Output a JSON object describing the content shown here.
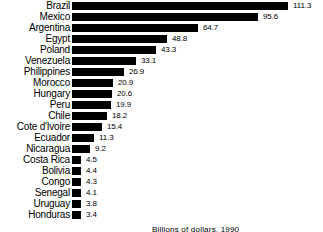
{
  "chart_data": {
    "type": "bar",
    "orientation": "horizontal",
    "title": "",
    "subtitle": "",
    "xlabel": "Billions of dollars, 1990",
    "ylabel": "",
    "grid": false,
    "legend": null,
    "xlim": [
      0,
      115
    ],
    "categories": [
      "Brazil",
      "Mexico",
      "Argentina",
      "Egypt",
      "Poland",
      "Venezuela",
      "Philippines",
      "Morocco",
      "Hungary",
      "Peru",
      "Chile",
      "Cote d'Ivoire",
      "Ecuador",
      "Nicaragua",
      "Costa Rica",
      "Bolivia",
      "Congo",
      "Senegal",
      "Uruguay",
      "Honduras"
    ],
    "values": [
      111.3,
      95.6,
      64.7,
      48.8,
      43.3,
      33.1,
      26.9,
      20.9,
      20.6,
      19.9,
      18.2,
      15.4,
      11.3,
      9.2,
      4.5,
      4.4,
      4.3,
      4.1,
      3.8,
      3.4
    ],
    "value_labels": [
      "111.3",
      "95.6",
      "64.7",
      "48.8",
      "43.3",
      "33.1",
      "26.9",
      "20.9",
      "20.6",
      "19.9",
      "18.2",
      "15.4",
      "11.3",
      "9.2",
      "4.5",
      "4.4",
      "4.3",
      "4.1",
      "3.8",
      "3.4"
    ],
    "bar_color": "#000000",
    "background_color": "#ffffff",
    "text_color": "#000000"
  },
  "caption": {
    "text": "Billions of dollars, 1990"
  }
}
